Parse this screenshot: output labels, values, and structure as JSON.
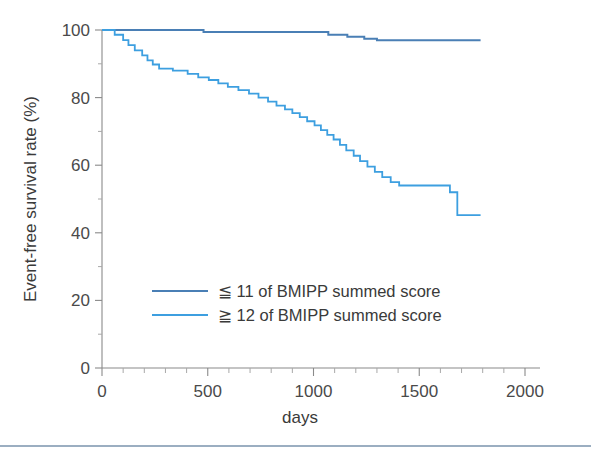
{
  "chart_data": {
    "type": "line",
    "title": "",
    "subtitle": "",
    "xlabel": "days",
    "ylabel": "Event-free survival rate (%)",
    "xlim": [
      0,
      2000
    ],
    "ylim": [
      0,
      100
    ],
    "x_ticks": [
      0,
      500,
      1000,
      1500,
      2000
    ],
    "x_tick_labels": [
      "0",
      "500",
      "1000",
      "1500",
      "2000"
    ],
    "x_minor_tick_interval": 100,
    "y_ticks": [
      0,
      20,
      40,
      60,
      80,
      100
    ],
    "y_tick_labels": [
      "0",
      "20",
      "40",
      "60",
      "80",
      "100"
    ],
    "y_minor_tick_interval": 10,
    "grid": false,
    "legend_position": "inside-lower-center",
    "annotations": [],
    "series": [
      {
        "name": "≦ 11 of BMIPP summed score",
        "color": "#4a7fb5",
        "style": "step-post",
        "linewidth": 2.0,
        "final_value": 97.0,
        "points": [
          [
            0,
            100.0
          ],
          [
            60,
            100.0
          ],
          [
            150,
            100.0
          ],
          [
            300,
            100.0
          ],
          [
            470,
            100.0
          ],
          [
            480,
            99.4
          ],
          [
            700,
            99.4
          ],
          [
            900,
            99.4
          ],
          [
            1060,
            99.4
          ],
          [
            1070,
            98.6
          ],
          [
            1150,
            98.6
          ],
          [
            1160,
            98.0
          ],
          [
            1230,
            98.0
          ],
          [
            1240,
            97.4
          ],
          [
            1290,
            97.4
          ],
          [
            1300,
            97.0
          ],
          [
            1500,
            97.0
          ],
          [
            1700,
            97.0
          ],
          [
            1790,
            97.0
          ]
        ]
      },
      {
        "name": "≧ 12 of BMIPP summed score",
        "color": "#3d9fe0",
        "style": "step-post",
        "linewidth": 1.8,
        "final_value": 45.2,
        "points": [
          [
            0,
            100.0
          ],
          [
            55,
            100.0
          ],
          [
            60,
            98.6
          ],
          [
            95,
            98.6
          ],
          [
            100,
            97.0
          ],
          [
            120,
            97.0
          ],
          [
            125,
            95.5
          ],
          [
            150,
            95.5
          ],
          [
            155,
            94.0
          ],
          [
            185,
            94.0
          ],
          [
            190,
            92.5
          ],
          [
            210,
            92.5
          ],
          [
            215,
            91.0
          ],
          [
            235,
            91.0
          ],
          [
            240,
            89.8
          ],
          [
            265,
            89.8
          ],
          [
            270,
            88.6
          ],
          [
            330,
            88.6
          ],
          [
            335,
            88.0
          ],
          [
            400,
            88.0
          ],
          [
            405,
            87.0
          ],
          [
            450,
            87.0
          ],
          [
            455,
            86.0
          ],
          [
            500,
            86.0
          ],
          [
            505,
            85.2
          ],
          [
            545,
            85.2
          ],
          [
            550,
            84.2
          ],
          [
            590,
            84.2
          ],
          [
            595,
            83.2
          ],
          [
            640,
            83.2
          ],
          [
            645,
            82.2
          ],
          [
            690,
            82.2
          ],
          [
            695,
            81.2
          ],
          [
            735,
            81.2
          ],
          [
            740,
            80.0
          ],
          [
            780,
            80.0
          ],
          [
            785,
            78.8
          ],
          [
            820,
            78.8
          ],
          [
            825,
            77.6
          ],
          [
            860,
            77.6
          ],
          [
            865,
            76.5
          ],
          [
            895,
            76.5
          ],
          [
            900,
            75.4
          ],
          [
            930,
            75.4
          ],
          [
            935,
            74.2
          ],
          [
            965,
            74.2
          ],
          [
            970,
            73.0
          ],
          [
            1000,
            73.0
          ],
          [
            1005,
            71.8
          ],
          [
            1030,
            71.8
          ],
          [
            1035,
            70.4
          ],
          [
            1060,
            70.4
          ],
          [
            1065,
            69.0
          ],
          [
            1090,
            69.0
          ],
          [
            1095,
            67.6
          ],
          [
            1120,
            67.6
          ],
          [
            1125,
            66.0
          ],
          [
            1150,
            66.0
          ],
          [
            1155,
            64.4
          ],
          [
            1185,
            64.4
          ],
          [
            1190,
            62.8
          ],
          [
            1215,
            62.8
          ],
          [
            1220,
            61.2
          ],
          [
            1250,
            61.2
          ],
          [
            1255,
            59.6
          ],
          [
            1285,
            59.6
          ],
          [
            1290,
            58.0
          ],
          [
            1320,
            58.0
          ],
          [
            1325,
            56.5
          ],
          [
            1360,
            56.5
          ],
          [
            1365,
            55.0
          ],
          [
            1400,
            55.0
          ],
          [
            1405,
            54.0
          ],
          [
            1640,
            54.0
          ],
          [
            1645,
            52.0
          ],
          [
            1675,
            52.0
          ],
          [
            1680,
            45.2
          ],
          [
            1790,
            45.2
          ]
        ]
      }
    ]
  },
  "legend": {
    "entries": [
      {
        "label": "≦ 11 of BMIPP summed score",
        "color": "#4a7fb5"
      },
      {
        "label": "≧ 12 of BMIPP summed score",
        "color": "#3d9fe0"
      }
    ]
  },
  "axes": {
    "x_title": "days",
    "y_title": "Event-free survival rate (%)"
  },
  "colors": {
    "series_low": "#4a7fb5",
    "series_high": "#3d9fe0",
    "axis": "#8a8a8a",
    "text": "#3a3a3a",
    "rule": "#7a93ad"
  }
}
